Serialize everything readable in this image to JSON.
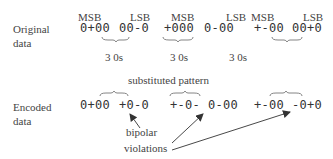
{
  "rows": {
    "original": {
      "label_line1": "Original",
      "label_line2": "data",
      "groups": [
        "0+00",
        "00-0",
        "+000",
        "0-00",
        "+-00",
        "00+0"
      ]
    },
    "encoded": {
      "label_line1": "Encoded",
      "label_line2": "data",
      "groups": [
        "0+00",
        "+0-0",
        "+-0-",
        "0-00",
        "+-00",
        "-0+0"
      ]
    }
  },
  "bit_markers": {
    "msb": "MSB",
    "lsb": "LSB",
    "words": [
      {
        "msb": "MSB",
        "lsb": "LSB"
      },
      {
        "msb": "MSB",
        "lsb": "LSB"
      },
      {
        "msb": "MSB",
        "lsb": "LSB"
      }
    ]
  },
  "zero_run_labels": [
    "3 0s",
    "3 0s",
    "3 0s"
  ],
  "substituted_label": "substituted pattern",
  "violations_label": {
    "line1": "bipolar",
    "line2": "violations"
  },
  "colors": {
    "text": "#444444",
    "lines": "#555555",
    "background": "#ffffff"
  }
}
